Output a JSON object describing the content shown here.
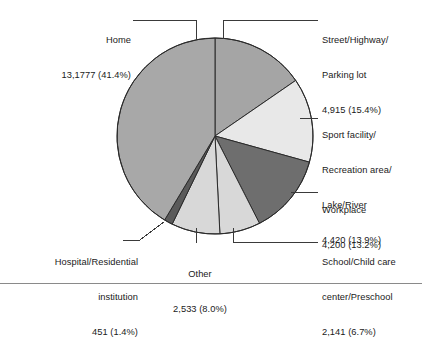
{
  "figure": {
    "divider_color": "#8a8a8a",
    "outline_color": "#2b2b2b",
    "background": "#ffffff"
  },
  "chart_data": {
    "type": "pie",
    "title": "",
    "subtitle": "",
    "xlabel": "",
    "ylabel": "",
    "legend_position": "callout-labels",
    "grid": false,
    "start_angle_deg": 0,
    "direction": "clockwise",
    "total": 318437,
    "categories": [
      "Street/Highway/Parking lot",
      "Sport facility/Recreation area/Lake/River",
      "Workplace",
      "School/Child care center/Preschool",
      "Other",
      "Hospital/Residential institution",
      "Home"
    ],
    "values": [
      4915,
      4420,
      4200,
      2141,
      2533,
      451,
      131777
    ],
    "percentages": [
      15.4,
      13.9,
      13.2,
      6.7,
      8.0,
      1.4,
      41.4
    ],
    "colors": [
      "#a5a5a5",
      "#e8e8e8",
      "#6e6e6e",
      "#d8d8d8",
      "#d8d8d8",
      "#5a5a5a",
      "#a8a8a8"
    ],
    "slices": [
      {
        "key": "street",
        "name": "Street/Highway/Parking lot",
        "value": 4915,
        "value_text": "4,915",
        "percent": 15.4,
        "percent_text": "(15.4%)",
        "color": "#a5a5a5"
      },
      {
        "key": "sport",
        "name": "Sport facility/Recreation area/Lake/River",
        "value": 4420,
        "value_text": "4,420",
        "percent": 13.9,
        "percent_text": "(13.9%)",
        "color": "#e8e8e8"
      },
      {
        "key": "workplace",
        "name": "Workplace",
        "value": 4200,
        "value_text": "4,200",
        "percent": 13.2,
        "percent_text": "(13.2%)",
        "color": "#6e6e6e"
      },
      {
        "key": "school",
        "name": "School/Child care center/Preschool",
        "value": 2141,
        "value_text": "2,141",
        "percent": 6.7,
        "percent_text": "(6.7%)",
        "color": "#d8d8d8"
      },
      {
        "key": "other",
        "name": "Other",
        "value": 2533,
        "value_text": "2,533",
        "percent": 8.0,
        "percent_text": "(8.0%)",
        "color": "#d8d8d8"
      },
      {
        "key": "hospital",
        "name": "Hospital/Residential institution",
        "value": 451,
        "value_text": "451",
        "percent": 1.4,
        "percent_text": "(1.4%)",
        "color": "#5a5a5a"
      },
      {
        "key": "home",
        "name": "Home",
        "value": 131777,
        "value_text": "13,1777",
        "percent": 41.4,
        "percent_text": "(41.4%)",
        "color": "#a8a8a8"
      }
    ]
  },
  "labels": {
    "home": {
      "line1": "Home",
      "line2": "13,1777 (41.4%)"
    },
    "street": {
      "line1": "Street/Highway/",
      "line2": "Parking lot",
      "line3": "4,915 (15.4%)"
    },
    "sport": {
      "line1": "Sport facility/",
      "line2": "Recreation area/",
      "line3": "Lake/River",
      "line4": "4,420 (13.9%)"
    },
    "workplace": {
      "line1": "Workplace",
      "line2": "4,200 (13.2%)"
    },
    "school": {
      "line1": "School/Child care",
      "line2": "center/Preschool",
      "line3": "2,141 (6.7%)"
    },
    "other": {
      "line1": "Other",
      "line2": "2,533 (8.0%)"
    },
    "hospital": {
      "line1": "Hospital/Residential",
      "line2": "institution",
      "line3": "451 (1.4%)"
    }
  }
}
